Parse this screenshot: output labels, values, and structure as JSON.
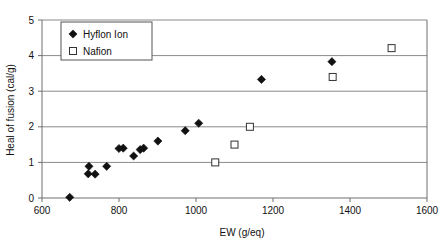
{
  "chart_data": {
    "type": "scatter",
    "title": "",
    "xlabel": "EW (g/eq)",
    "ylabel": "Heal of fusion (cal/g)",
    "xlim": [
      600,
      1600
    ],
    "ylim": [
      0,
      5
    ],
    "xticks": [
      600,
      800,
      1000,
      1200,
      1400,
      1600
    ],
    "yticks": [
      0,
      1,
      2,
      3,
      4,
      5
    ],
    "grid": "horizontal",
    "legend_position": "top-left-inside",
    "series": [
      {
        "name": "Hyflon Ion",
        "marker": "filled-diamond",
        "color": "#111111",
        "points": [
          {
            "x": 672,
            "y": 0.02
          },
          {
            "x": 722,
            "y": 0.89
          },
          {
            "x": 720,
            "y": 0.68
          },
          {
            "x": 738,
            "y": 0.67
          },
          {
            "x": 768,
            "y": 0.89
          },
          {
            "x": 800,
            "y": 1.39
          },
          {
            "x": 811,
            "y": 1.4
          },
          {
            "x": 838,
            "y": 1.18
          },
          {
            "x": 855,
            "y": 1.36
          },
          {
            "x": 864,
            "y": 1.4
          },
          {
            "x": 901,
            "y": 1.6
          },
          {
            "x": 972,
            "y": 1.89
          },
          {
            "x": 1007,
            "y": 2.1
          },
          {
            "x": 1170,
            "y": 3.33
          },
          {
            "x": 1353,
            "y": 3.83
          }
        ]
      },
      {
        "name": "Nafion",
        "marker": "open-square",
        "color": "#ffffff",
        "points": [
          {
            "x": 1050,
            "y": 1.0
          },
          {
            "x": 1100,
            "y": 1.5
          },
          {
            "x": 1140,
            "y": 2.0
          },
          {
            "x": 1355,
            "y": 3.4
          },
          {
            "x": 1508,
            "y": 4.21
          }
        ]
      }
    ]
  },
  "legend": {
    "items": [
      {
        "label": "Hyflon Ion",
        "marker": "filled-diamond"
      },
      {
        "label": "Nafion",
        "marker": "open-square"
      }
    ]
  },
  "axes": {
    "x_title": "EW (g/eq)",
    "y_title": "Heal of fusion (cal/g)",
    "x_tick_labels": [
      "600",
      "800",
      "1000",
      "1200",
      "1400",
      "1600"
    ],
    "y_tick_labels": [
      "0",
      "1",
      "2",
      "3",
      "4",
      "5"
    ]
  }
}
